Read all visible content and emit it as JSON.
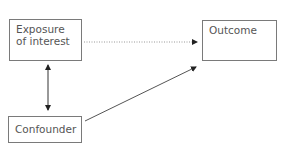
{
  "diagram": {
    "type": "causal-confounding-diagram",
    "nodes": {
      "exposure": "Exposure of interest",
      "outcome": "Outcome",
      "confounder": "Confounder"
    },
    "edges": [
      {
        "from": "exposure",
        "to": "outcome",
        "style": "dotted",
        "direction": "forward"
      },
      {
        "from": "exposure",
        "to": "confounder",
        "style": "solid",
        "direction": "bidirectional"
      },
      {
        "from": "confounder",
        "to": "outcome",
        "style": "solid",
        "direction": "forward"
      }
    ],
    "colors": {
      "line": "#555555",
      "border": "#7a7a7a",
      "text": "#555555"
    }
  }
}
